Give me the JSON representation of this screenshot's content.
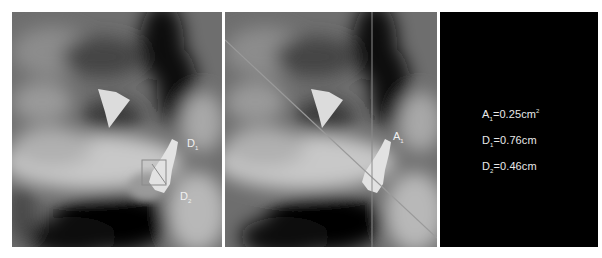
{
  "figure": {
    "panels": [
      {
        "id": "left",
        "description": "ultrasound grayscale image with lesion and measurement box",
        "labels": [
          {
            "base": "D",
            "sub": "1"
          },
          {
            "base": "D",
            "sub": "2"
          }
        ]
      },
      {
        "id": "middle",
        "description": "same ultrasound image with diagonal and vertical measurement lines",
        "labels": [
          {
            "base": "A",
            "sub": "1"
          }
        ]
      },
      {
        "id": "right",
        "description": "black measurement results panel",
        "measurements": [
          {
            "base": "A",
            "sub": "1",
            "value": "=0.25cm",
            "sup": "2"
          },
          {
            "base": "D",
            "sub": "1",
            "value": "=0.76cm",
            "sup": ""
          },
          {
            "base": "D",
            "sub": "2",
            "value": "=0.46cm",
            "sup": ""
          }
        ]
      }
    ],
    "colors": {
      "background": "#ffffff",
      "results_panel": "#000000",
      "text": "#e8e8e8",
      "measure_line": "#8a8a8a"
    }
  }
}
